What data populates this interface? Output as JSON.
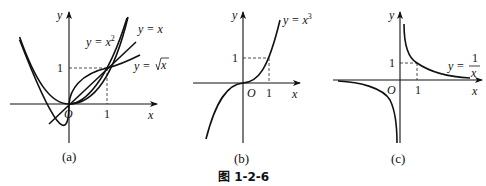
{
  "figure": {
    "caption": "图 1-2-6",
    "panels": [
      {
        "id": "a",
        "label": "(a)",
        "axis_x": "x",
        "axis_y": "y",
        "origin": "O",
        "tick_x": "1",
        "tick_y": "1",
        "curves": [
          {
            "name": "y = x²",
            "label_main": "y = x",
            "label_sup": "2"
          },
          {
            "name": "y = x",
            "label_main": "y = x"
          },
          {
            "name": "y = √x",
            "label_main": "y = ",
            "label_rad": "x"
          }
        ]
      },
      {
        "id": "b",
        "label": "(b)",
        "axis_x": "x",
        "axis_y": "y",
        "origin": "O",
        "tick_x": "1",
        "tick_y": "1",
        "curves": [
          {
            "name": "y = x³",
            "label_main": "y = x",
            "label_sup": "3"
          }
        ]
      },
      {
        "id": "c",
        "label": "(c)",
        "axis_x": "x",
        "axis_y": "y",
        "origin": "O",
        "tick_x": "1",
        "tick_y": "1",
        "curves": [
          {
            "name": "y = 1/x",
            "label_main": "y =",
            "label_num": "1",
            "label_den": "x"
          }
        ]
      }
    ]
  }
}
